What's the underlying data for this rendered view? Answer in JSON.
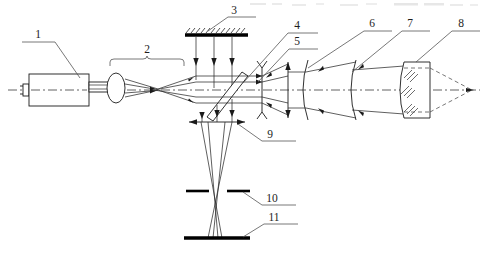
{
  "figure": {
    "canvas": {
      "width": 485,
      "height": 260
    },
    "background_color": "#ffffff",
    "line_color": "#1a1a1a",
    "axis_style": "dash-dot center optical axis"
  },
  "labels": [
    {
      "id": "1",
      "text": "1",
      "x": 38,
      "y": 35,
      "leader_to_x": 75,
      "leader_to_y": 78,
      "refers_to": "laser-source"
    },
    {
      "id": "2",
      "text": "2",
      "x": 147,
      "y": 53,
      "leader_to_x": 147,
      "leader_to_y": 60,
      "refers_to": "beam-expander-bracket"
    },
    {
      "id": "3",
      "text": "3",
      "x": 232,
      "y": 20,
      "leader_to_x": 208,
      "leader_to_y": 31,
      "refers_to": "reference-mirror"
    },
    {
      "id": "4",
      "text": "4",
      "x": 297,
      "y": 29,
      "leader_to_x": 243,
      "leader_to_y": 83,
      "refers_to": "beam-splitter"
    },
    {
      "id": "5",
      "text": "5",
      "x": 297,
      "y": 45,
      "leader_to_x": 262,
      "leader_to_y": 78,
      "refers_to": "field-stop-reticle"
    },
    {
      "id": "6",
      "text": "6",
      "x": 372,
      "y": 27,
      "leader_to_x": 308,
      "leader_to_y": 68,
      "refers_to": "collimating-lens"
    },
    {
      "id": "7",
      "text": "7",
      "x": 410,
      "y": 27,
      "leader_to_x": 356,
      "leader_to_y": 70,
      "refers_to": "objective-lens"
    },
    {
      "id": "8",
      "text": "8",
      "x": 461,
      "y": 27,
      "leader_to_x": 404,
      "leader_to_y": 68,
      "refers_to": "plano-convex-lens"
    },
    {
      "id": "9",
      "text": "9",
      "x": 270,
      "y": 148,
      "leader_to_x": 240,
      "leader_to_y": 124,
      "refers_to": "imaging-lens"
    },
    {
      "id": "10",
      "text": "10",
      "x": 272,
      "y": 201,
      "leader_to_x": 245,
      "leader_to_y": 191,
      "refers_to": "aperture-stop"
    },
    {
      "id": "11",
      "text": "11",
      "x": 274,
      "y": 227,
      "leader_to_x": 247,
      "leader_to_y": 236,
      "refers_to": "detector-plane"
    }
  ],
  "components": [
    {
      "key": "laser-source",
      "number": "1",
      "kind": "laser tube with output window and collimator lens"
    },
    {
      "key": "beam-expander-bracket",
      "number": "2",
      "kind": "beam expander / spatial filter group (brace span)"
    },
    {
      "key": "reference-mirror",
      "number": "3",
      "kind": "hatched reference mirror, horizontal"
    },
    {
      "key": "beam-splitter",
      "number": "4",
      "kind": "tilted plate beam splitter at 45 degrees"
    },
    {
      "key": "field-stop-reticle",
      "number": "5",
      "kind": "vertical reticle / field stop with forked ends"
    },
    {
      "key": "collimating-lens",
      "number": "6",
      "kind": "meniscus lens, concave arc"
    },
    {
      "key": "objective-lens",
      "number": "7",
      "kind": "meniscus lens, concave arc"
    },
    {
      "key": "plano-convex-lens",
      "number": "8",
      "kind": "hatched plano-convex test lens, focus at right"
    },
    {
      "key": "imaging-lens",
      "number": "9",
      "kind": "horizontal imaging lens below splitter"
    },
    {
      "key": "aperture-stop",
      "number": "10",
      "kind": "aperture stop, two bars with central gap"
    },
    {
      "key": "detector-plane",
      "number": "11",
      "kind": "detector / image plane bar"
    }
  ],
  "axis": {
    "label": "optical-axis",
    "y": 90,
    "x_start": 8,
    "x_end": 480
  }
}
